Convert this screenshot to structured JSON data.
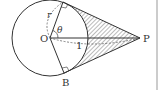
{
  "diagram": {
    "type": "geometry",
    "points": {
      "O": {
        "label": "O",
        "x": 50,
        "y": 38
      },
      "A": {
        "label": "A",
        "x": 63,
        "y": 2
      },
      "B": {
        "label": "B",
        "x": 64,
        "y": 73
      },
      "P": {
        "label": "P",
        "x": 140,
        "y": 38
      }
    },
    "labels": {
      "center": "O",
      "tangent_point_bottom": "B",
      "external_point": "P",
      "radius": "r",
      "angle": "θ",
      "length": "1"
    },
    "colors": {
      "stroke": "#333333",
      "hatch": "#555555",
      "border": "#bbbbbb",
      "background": "#ffffff"
    }
  }
}
